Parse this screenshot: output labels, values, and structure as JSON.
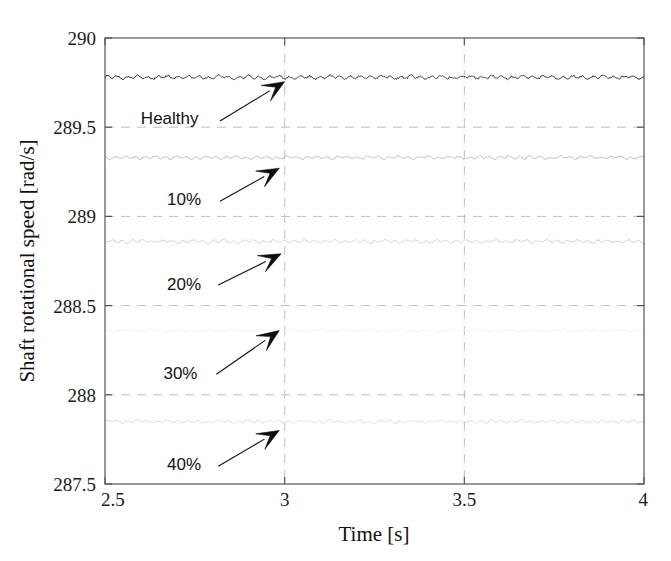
{
  "chart_data": {
    "type": "line",
    "title": "",
    "xlabel": "Time [s]",
    "ylabel": "Shaft rotational speed [rad/s]",
    "xlim": [
      2.5,
      4
    ],
    "ylim": [
      287.5,
      290
    ],
    "xticks": [
      "2.5",
      "3",
      "3.5",
      "4"
    ],
    "xtick_values": [
      2.5,
      3,
      3.5,
      4
    ],
    "yticks": [
      "287.5",
      "288",
      "288.5",
      "289",
      "289.5",
      "290"
    ],
    "ytick_values": [
      287.5,
      288,
      288.5,
      289,
      289.5,
      290
    ],
    "grid": true,
    "grid_style": "dashed",
    "legend": "none",
    "annotations_style": "arrow-callouts",
    "series": [
      {
        "name": "Healthy",
        "label": "Healthy",
        "mean": 289.78,
        "ripple_amplitude": 0.012,
        "color": "#3a3a3a",
        "linewidth": 1.0,
        "label_x": 2.68,
        "label_y": 289.55,
        "arrow_from": [
          2.82,
          289.535
        ],
        "arrow_to": [
          3.0,
          289.755
        ]
      },
      {
        "name": "10%",
        "label": "10%",
        "mean": 289.33,
        "ripple_amplitude": 0.011,
        "color": "#b9b9b9",
        "linewidth": 0.9,
        "label_x": 2.72,
        "label_y": 289.1,
        "arrow_from": [
          2.82,
          289.085
        ],
        "arrow_to": [
          2.985,
          289.27
        ]
      },
      {
        "name": "20%",
        "label": "20%",
        "mean": 288.86,
        "ripple_amplitude": 0.011,
        "color": "#cfcfcf",
        "linewidth": 0.9,
        "label_x": 2.72,
        "label_y": 288.62,
        "arrow_from": [
          2.815,
          288.615
        ],
        "arrow_to": [
          2.99,
          288.79
        ]
      },
      {
        "name": "30%",
        "label": "30%",
        "mean": 288.36,
        "ripple_amplitude": 0.01,
        "color": "#f1f1f1",
        "linewidth": 0.9,
        "label_x": 2.71,
        "label_y": 288.12,
        "arrow_from": [
          2.81,
          288.115
        ],
        "arrow_to": [
          2.985,
          288.36
        ]
      },
      {
        "name": "40%",
        "label": "40%",
        "mean": 287.85,
        "ripple_amplitude": 0.01,
        "color": "#dadada",
        "linewidth": 0.9,
        "label_x": 2.72,
        "label_y": 287.61,
        "arrow_from": [
          2.815,
          287.6
        ],
        "arrow_to": [
          2.985,
          287.8
        ]
      }
    ]
  },
  "axes": {
    "x_title": "Time [s]",
    "y_title": "Shaft rotational speed [rad/s]"
  },
  "colors": {
    "axis": "#555555",
    "grid": "#bfbfbf",
    "text": "#111111",
    "background": "#ffffff"
  }
}
